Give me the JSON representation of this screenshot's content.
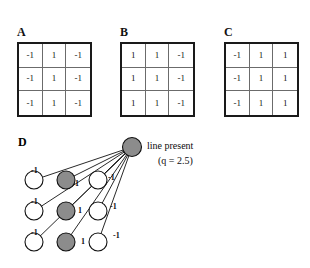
{
  "figure": {
    "background_color": "#ffffff",
    "panels": [
      {
        "label": "A",
        "rows": [
          [
            "-1",
            "1",
            "-1"
          ],
          [
            "-1",
            "1",
            "-1"
          ],
          [
            "-1",
            "1",
            "-1"
          ]
        ]
      },
      {
        "label": "B",
        "rows": [
          [
            "1",
            "1",
            "-1"
          ],
          [
            "1",
            "1",
            "-1"
          ],
          [
            "1",
            "1",
            "-1"
          ]
        ]
      },
      {
        "label": "C",
        "rows": [
          [
            "-1",
            "1",
            "1"
          ],
          [
            "-1",
            "1",
            "1"
          ],
          [
            "-1",
            "1",
            "1"
          ]
        ]
      }
    ],
    "network": {
      "label": "D",
      "output_label_line1": "line present",
      "output_label_line2": "(q = 2.5)",
      "output_node_color": "#8c8c8c",
      "filled_node_color": "#8c8c8c",
      "open_node_color": "#ffffff",
      "edge_color": "#111111",
      "weights": [
        {
          "value": "-1",
          "column": 1,
          "row": 1
        },
        {
          "value": "-1",
          "column": 1,
          "row": 2
        },
        {
          "value": "-1",
          "column": 1,
          "row": 3
        },
        {
          "value": "1",
          "column": 2,
          "row": 1
        },
        {
          "value": "1",
          "column": 2,
          "row": 2
        },
        {
          "value": "1",
          "column": 2,
          "row": 3
        },
        {
          "value": "-1",
          "column": 3,
          "row": 1
        },
        {
          "value": "-1",
          "column": 3,
          "row": 2
        },
        {
          "value": "-1",
          "column": 3,
          "row": 3
        }
      ]
    }
  }
}
